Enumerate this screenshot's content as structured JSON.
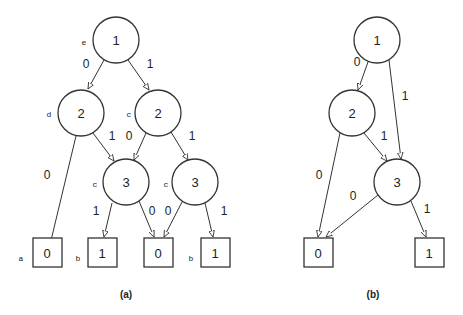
{
  "diagram_a": {
    "caption": "(a)",
    "nodes": [
      {
        "id": "a1",
        "type": "circle",
        "label": "1",
        "var": "e",
        "x": 116,
        "y": 40
      },
      {
        "id": "a2l",
        "type": "circle",
        "label": "2",
        "var": "d",
        "x": 81,
        "y": 113
      },
      {
        "id": "a2r",
        "type": "circle",
        "label": "2",
        "var": "c",
        "x": 158,
        "y": 113
      },
      {
        "id": "a3l",
        "type": "circle",
        "label": "3",
        "var": "c",
        "x": 126,
        "y": 182
      },
      {
        "id": "a3r",
        "type": "circle",
        "label": "3",
        "var": "c",
        "x": 195,
        "y": 182
      },
      {
        "id": "t0a",
        "type": "box",
        "label": "0",
        "var": "a",
        "x": 47,
        "y": 268
      },
      {
        "id": "t1a",
        "type": "box",
        "label": "1",
        "var": "b",
        "x": 102,
        "y": 268
      },
      {
        "id": "t0b",
        "type": "box",
        "label": "0",
        "var": "",
        "x": 158,
        "y": 268
      },
      {
        "id": "t1b",
        "type": "box",
        "label": "1",
        "var": "b",
        "x": 215,
        "y": 268
      }
    ],
    "edges": [
      {
        "from": "a1",
        "to": "a2l",
        "label": "0"
      },
      {
        "from": "a1",
        "to": "a2r",
        "label": "1"
      },
      {
        "from": "a2l",
        "to": "t0a",
        "label": "0"
      },
      {
        "from": "a2l",
        "to": "a3l",
        "label": "1"
      },
      {
        "from": "a2r",
        "to": "a3l",
        "label": "0"
      },
      {
        "from": "a2r",
        "to": "a3r",
        "label": "1"
      },
      {
        "from": "a3l",
        "to": "t1a",
        "label": "1"
      },
      {
        "from": "a3l",
        "to": "t0b",
        "label": "0"
      },
      {
        "from": "a3r",
        "to": "t0b",
        "label": "0"
      },
      {
        "from": "a3r",
        "to": "t1b",
        "label": "1"
      }
    ]
  },
  "diagram_b": {
    "caption": "(b)",
    "nodes": [
      {
        "id": "b1",
        "type": "circle",
        "label": "1",
        "var": "",
        "x": 377,
        "y": 40
      },
      {
        "id": "b2",
        "type": "circle",
        "label": "2",
        "var": "",
        "x": 352,
        "y": 113
      },
      {
        "id": "b3",
        "type": "circle",
        "label": "3",
        "var": "",
        "x": 397,
        "y": 182
      },
      {
        "id": "bt0",
        "type": "box",
        "label": "0",
        "var": "",
        "x": 318,
        "y": 253
      },
      {
        "id": "bt1",
        "type": "box",
        "label": "1",
        "var": "",
        "x": 429,
        "y": 253
      }
    ],
    "edges": [
      {
        "from": "b1",
        "to": "b2",
        "label": "0"
      },
      {
        "from": "b1",
        "to": "b3",
        "label": "1"
      },
      {
        "from": "b2",
        "to": "bt0",
        "label": "0"
      },
      {
        "from": "b2",
        "to": "b3",
        "label": "1"
      },
      {
        "from": "b3",
        "to": "bt0",
        "label": "0"
      },
      {
        "from": "b3",
        "to": "bt1",
        "label": "1"
      }
    ]
  },
  "texts": {
    "a_root": "1",
    "a_root_var": "e",
    "a_2l": "2",
    "a_2l_var": "d",
    "a_2r": "2",
    "a_2r_var": "c",
    "a_3l": "3",
    "a_3l_var": "c",
    "a_3r": "3",
    "a_3r_var": "c",
    "a_t0a": "0",
    "a_t0a_var": "a",
    "a_t1a": "1",
    "a_t1a_var": "b",
    "a_t0b": "0",
    "a_t1b": "1",
    "a_t1b_var": "b",
    "a_e_1_2l": "0",
    "a_e_1_2r": "1",
    "a_e_2l_t0": "0",
    "a_e_2l_3l": "1",
    "a_e_2r_3l": "0",
    "a_e_2r_3r": "1",
    "a_e_3l_t1": "1",
    "a_e_3l_t0": "0",
    "a_e_3r_t0": "0",
    "a_e_3r_t1": "1",
    "caption_a": "(a)",
    "b_root": "1",
    "b_2": "2",
    "b_3": "3",
    "b_t0": "0",
    "b_t1": "1",
    "b_e_1_2": "0",
    "b_e_1_3": "1",
    "b_e_2_t0": "0",
    "b_e_2_3": "1",
    "b_e_3_t0": "0",
    "b_e_3_t1": "1",
    "caption_b": "(b)"
  }
}
